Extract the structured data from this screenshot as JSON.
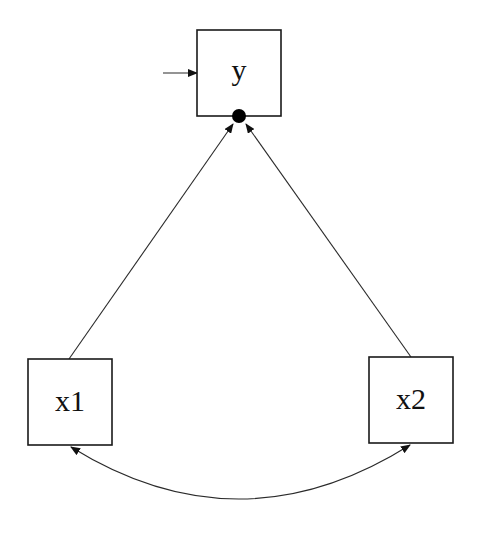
{
  "diagram": {
    "type": "path-diagram",
    "nodes": [
      {
        "id": "y",
        "label": "y",
        "shape": "rectangle",
        "role": "dependent"
      },
      {
        "id": "x1",
        "label": "x1",
        "shape": "rectangle",
        "role": "predictor"
      },
      {
        "id": "x2",
        "label": "x2",
        "shape": "rectangle",
        "role": "predictor"
      }
    ],
    "edges": [
      {
        "from": "x1",
        "to": "y",
        "kind": "regression",
        "arrow": "single"
      },
      {
        "from": "x2",
        "to": "y",
        "kind": "regression",
        "arrow": "single"
      },
      {
        "from": "x1",
        "to": "x2",
        "kind": "covariance",
        "arrow": "double",
        "curved": true
      },
      {
        "from": "residual",
        "to": "y",
        "kind": "residual",
        "arrow": "single"
      }
    ],
    "markers": [
      {
        "node": "y",
        "kind": "intercept-dot",
        "color": "#000000"
      }
    ],
    "colors": {
      "stroke": "#1a1a1a",
      "background": "#ffffff"
    }
  }
}
